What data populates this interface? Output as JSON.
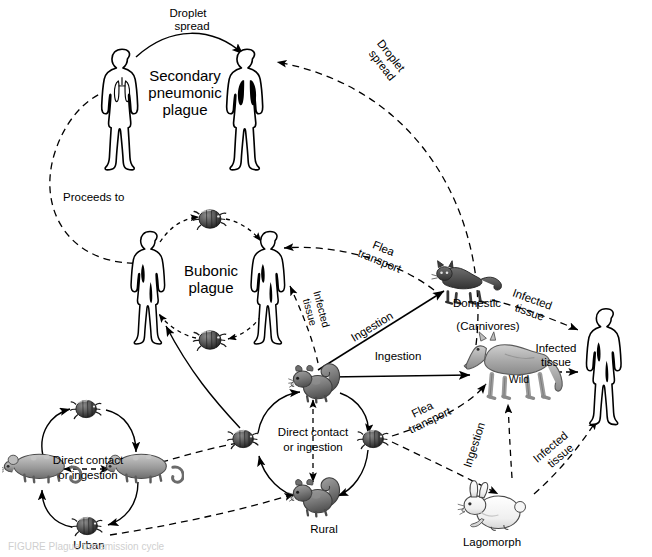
{
  "figure": {
    "background": "#ffffff",
    "stroke": "#000000",
    "width": 652,
    "height": 557
  },
  "labels": {
    "droplet_spread_top": "Droplet\nspread",
    "droplet_spread_top_l1": "Droplet",
    "droplet_spread_top_l2": "spread",
    "droplet_spread_right_l1": "Droplet",
    "droplet_spread_right_l2": "spread",
    "secondary_pneumonic_l1": "Secondary",
    "secondary_pneumonic_l2": "pneumonic",
    "secondary_pneumonic_l3": "plague",
    "proceeds_to": "Proceeds to",
    "bubonic_l1": "Bubonic",
    "bubonic_l2": "plague",
    "flea_transport_upper_l1": "Flea",
    "flea_transport_upper_l2": "transport",
    "flea_transport_lower_l1": "Flea",
    "flea_transport_lower_l2": "transport",
    "infected_tissue_bubonic_l1": "Infected",
    "infected_tissue_bubonic_l2": "tissue",
    "infected_tissue_cat_l1": "Infected",
    "infected_tissue_cat_l2": "tissue",
    "infected_tissue_wild_l1": "Infected",
    "infected_tissue_wild_l2": "tissue",
    "infected_tissue_lago_l1": "Infected",
    "infected_tissue_lago_l2": "tissue",
    "ingestion_cat": "Ingestion",
    "ingestion_wild": "Ingestion",
    "ingestion_lagomorph": "Ingestion",
    "direct_contact_urban_l1": "Direct contact",
    "direct_contact_urban_l2": "or ingestion",
    "direct_contact_rural_l1": "Direct contact",
    "direct_contact_rural_l2": "or ingestion",
    "domestic": "Domestic",
    "carnivores": "(Carnivores)",
    "wild": "Wild",
    "urban": "Urban",
    "rural": "Rural",
    "lagomorph": "Lagomorph",
    "bottom_caption": "FIGURE  Plague transmission cycle"
  },
  "nodes": [
    {
      "name": "human-pneumonic-source",
      "type": "human",
      "label": ""
    },
    {
      "name": "human-pneumonic-target",
      "type": "human",
      "label": ""
    },
    {
      "name": "human-bubonic-left",
      "type": "human",
      "label": ""
    },
    {
      "name": "human-bubonic-right",
      "type": "human",
      "label": ""
    },
    {
      "name": "human-right",
      "type": "human",
      "label": ""
    },
    {
      "name": "cat-domestic",
      "type": "cat",
      "label": "Domestic"
    },
    {
      "name": "coyote-wild",
      "type": "coyote",
      "label": "Wild"
    },
    {
      "name": "rabbit-lagomorph",
      "type": "rabbit",
      "label": "Lagomorph"
    },
    {
      "name": "rat-urban-left",
      "type": "rat",
      "label": ""
    },
    {
      "name": "rat-urban-right",
      "type": "rat",
      "label": ""
    },
    {
      "name": "squirrel-rural-top",
      "type": "squirrel",
      "label": ""
    },
    {
      "name": "squirrel-rural-bottom",
      "type": "squirrel",
      "label": "Rural"
    },
    {
      "name": "flea-bubonic-top",
      "type": "flea",
      "label": ""
    },
    {
      "name": "flea-bubonic-bottom",
      "type": "flea",
      "label": ""
    },
    {
      "name": "flea-urban-top",
      "type": "flea",
      "label": ""
    },
    {
      "name": "flea-urban-bottom",
      "type": "flea",
      "label": "Urban"
    },
    {
      "name": "flea-rural-left",
      "type": "flea",
      "label": ""
    },
    {
      "name": "flea-rural-right",
      "type": "flea",
      "label": ""
    }
  ],
  "colors": {
    "flea": "#4a4a4a",
    "rat": "#9a9a9a",
    "squirrel": "#7d7d7d",
    "cat": "#5a5a5a",
    "coyote": "#b0b0b0",
    "rabbit": "#f2f2f2",
    "human_outline": "#000000",
    "lung_dark": "#000000"
  }
}
